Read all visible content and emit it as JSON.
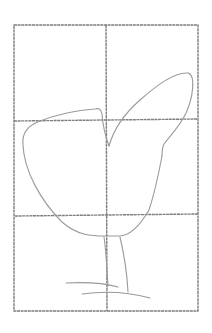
{
  "image": {
    "description": "Pencil sketch of a bird body outline with upraised wing and legs over a 2x3 drawing grid",
    "colors": {
      "background": "#ffffff",
      "grid": "#7d7d7d",
      "sketch": "#9a9a9a"
    },
    "grid": {
      "columns": 2,
      "rows": 3,
      "left": 14,
      "top": 25,
      "right": 198,
      "bottom": 311,
      "vertical_divider_x": 106,
      "horizontal_dividers_y": [
        120,
        215
      ]
    },
    "elements": [
      "grid-frame",
      "body-outline",
      "wing-outline",
      "front-leg",
      "back-leg",
      "ground-line-upper",
      "ground-line-lower"
    ]
  }
}
